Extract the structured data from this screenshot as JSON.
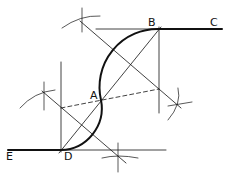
{
  "diagram": {
    "labels": {
      "A": "A",
      "B": "B",
      "C": "C",
      "D": "D",
      "E": "E"
    },
    "points": {
      "A": [
        101,
        100
      ],
      "B": [
        159,
        29
      ],
      "C": [
        222,
        29
      ],
      "D": [
        61,
        150
      ],
      "E": [
        8,
        150
      ]
    },
    "colors": {
      "stroke": "#111111",
      "background": "#ffffff"
    }
  }
}
